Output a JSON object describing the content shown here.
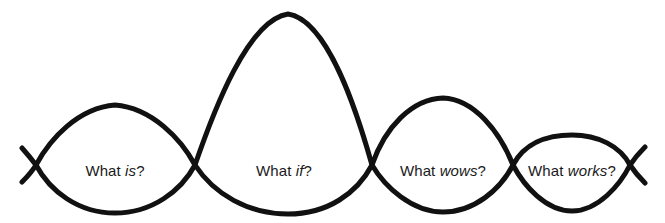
{
  "diagram": {
    "title": "What is? What if? What wows? What works?",
    "type": "double-diamond-four-lens-curve",
    "background_color": "#ffffff",
    "stroke_color": "#111111",
    "stroke_width": 5,
    "text_color": "#1a1a1a",
    "stages": [
      {
        "id": "what-is",
        "label_full": "What is?",
        "label_prefix": "What ",
        "label_emphasis": "is",
        "label_suffix": "?",
        "center_x": 115,
        "center_y": 170,
        "peak_y": 105,
        "trough_y": 213
      },
      {
        "id": "what-if",
        "label_full": "What if?",
        "label_prefix": "What ",
        "label_emphasis": "if",
        "label_suffix": "?",
        "center_x": 284,
        "center_y": 170,
        "peak_y": 14,
        "trough_y": 214
      },
      {
        "id": "what-wows",
        "label_full": "What wows?",
        "label_prefix": "What ",
        "label_emphasis": "wows",
        "label_suffix": "?",
        "center_x": 443,
        "center_y": 170,
        "peak_y": 98,
        "trough_y": 212
      },
      {
        "id": "what-works",
        "label_full": "What works?",
        "label_prefix": "What ",
        "label_emphasis": "works",
        "label_suffix": "?",
        "center_x": 572,
        "center_y": 170,
        "peak_y": 135,
        "trough_y": 211
      }
    ],
    "crossings": [
      {
        "x": 36,
        "y": 165
      },
      {
        "x": 195,
        "y": 165
      },
      {
        "x": 372,
        "y": 165
      },
      {
        "x": 513,
        "y": 165
      },
      {
        "x": 630,
        "y": 165
      }
    ],
    "curves": {
      "upper_path": "M 22,148 C 30,157 33,161 36,165 C 50,139 78,108 115,105 C 152,108 181,139 195,165 C 214,110 248,20 288,14 C 328,20 357,112 372,165 C 385,127 412,99 443,98 C 474,99 500,132 513,165 C 524,144 546,135 572,135 C 598,135 620,146 630,165 C 634,171 638,176 645,183",
      "lower_path": "M 22,182 C 30,174 33,170 36,165 C 50,191 78,213 115,213 C 152,213 181,191 195,165 C 214,194 248,214 288,214 C 328,214 357,193 372,165 C 385,187 412,212 443,212 C 474,212 500,190 513,165 C 524,186 546,211 572,211 C 598,211 620,185 630,165 C 634,159 638,154 645,147"
    }
  }
}
